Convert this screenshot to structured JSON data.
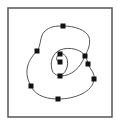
{
  "diagram": {
    "type": "spline-curve-with-control-points",
    "frame": {
      "x": 8,
      "y": 8,
      "width": 104,
      "height": 109,
      "stroke": "#555555"
    },
    "curve": {
      "stroke": "#555555",
      "path": "M 60 62 C 56 62, 55 56, 60 54 C 66 52, 70 62, 66 70 C 63 77, 54 77, 52 70 C 50 62, 52 54, 60 50 C 70 46, 82 50, 85 56 C 87 60, 88 62, 88 64 C 90 69, 95 73, 94 79 C 93 92, 75 99, 58 99 C 42 99, 34 93, 31 86 C 24 74, 26 62, 37 51 C 41 46, 40 36, 44 32 C 50 26, 56 26, 63 26 C 75 26, 86 30, 89 37 C 91 44, 88 50, 85 56 C 80 68, 72 76, 60 76",
      "stroke_width": 1
    },
    "control_points": [
      {
        "x": 63,
        "y": 26
      },
      {
        "x": 37,
        "y": 51
      },
      {
        "x": 85,
        "y": 56
      },
      {
        "x": 88,
        "y": 64
      },
      {
        "x": 94,
        "y": 79
      },
      {
        "x": 31,
        "y": 86
      },
      {
        "x": 58,
        "y": 99
      },
      {
        "x": 60,
        "y": 54
      },
      {
        "x": 60,
        "y": 62
      },
      {
        "x": 60,
        "y": 76
      }
    ],
    "point_color": "#111111",
    "point_size": 5
  }
}
